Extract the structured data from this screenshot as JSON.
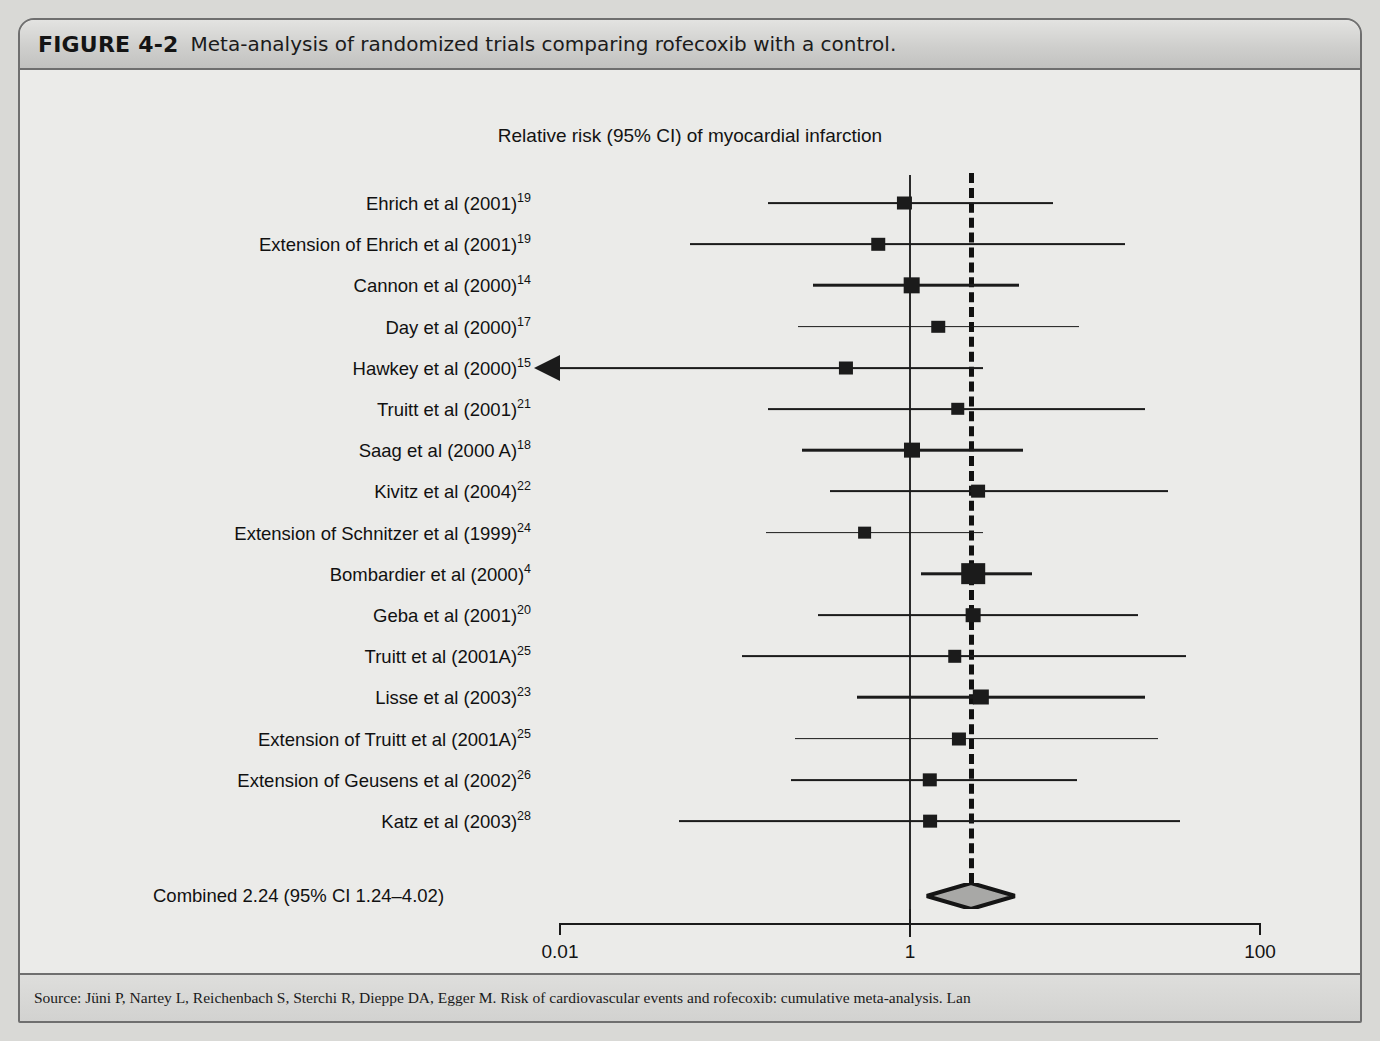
{
  "figure": {
    "label": "FIGURE 4-2",
    "caption": "Meta-analysis of randomized trials comparing rofecoxib with a control.",
    "source_text": "Source: Jüni P, Nartey L, Reichenbach S, Sterchi R, Dieppe DA, Egger M. Risk of cardiovascular events and rofecoxib: cumulative meta-analysis. Lan"
  },
  "chart_data": {
    "type": "forest",
    "title": "Relative risk (95% CI) of myocardial infarction",
    "xlabel": "",
    "ylabel": "",
    "xscale": "log",
    "xlim": [
      0.01,
      100
    ],
    "xticks": [
      0.01,
      1,
      100
    ],
    "xtick_labels": [
      "0.01",
      "1",
      "100"
    ],
    "left_foot_label": "Favours rofecoxib",
    "right_foot_label": "Favours control",
    "reference_line": 1,
    "pooled_line": 2.24,
    "grid": false,
    "legend": "none",
    "combined_label": "Combined 2.24 (95% CI 1.24–4.02)",
    "combined": {
      "estimate": 2.24,
      "ci_low": 1.24,
      "ci_high": 4.02
    },
    "studies": [
      {
        "label": "Ehrich et al (2001)",
        "ref": "19",
        "estimate": 0.93,
        "ci_low": 0.155,
        "ci_high": 6.6,
        "weight": 2.2,
        "arrow_left": false
      },
      {
        "label": "Extension of Ehrich et al (2001)",
        "ref": "19",
        "estimate": 0.66,
        "ci_low": 0.055,
        "ci_high": 17.0,
        "weight": 2.0,
        "arrow_left": false
      },
      {
        "label": "Cannon et al (2000)",
        "ref": "14",
        "estimate": 1.02,
        "ci_low": 0.28,
        "ci_high": 4.2,
        "weight": 3.0,
        "arrow_left": false
      },
      {
        "label": "Day et al (2000)",
        "ref": "17",
        "estimate": 1.45,
        "ci_low": 0.23,
        "ci_high": 9.2,
        "weight": 2.0,
        "arrow_left": false
      },
      {
        "label": "Hawkey et al (2000)",
        "ref": "15",
        "estimate": 0.43,
        "ci_low": 0.01,
        "ci_high": 2.6,
        "weight": 2.2,
        "arrow_left": true
      },
      {
        "label": "Truitt et al (2001)",
        "ref": "21",
        "estimate": 1.88,
        "ci_low": 0.155,
        "ci_high": 22.0,
        "weight": 2.0,
        "arrow_left": false
      },
      {
        "label": "Saag et al (2000 A)",
        "ref": "18",
        "estimate": 1.02,
        "ci_low": 0.24,
        "ci_high": 4.4,
        "weight": 2.8,
        "arrow_left": false
      },
      {
        "label": "Kivitz et al (2004)",
        "ref": "22",
        "estimate": 2.45,
        "ci_low": 0.35,
        "ci_high": 30.0,
        "weight": 2.1,
        "arrow_left": false
      },
      {
        "label": "Extension of Schnitzer et al (1999)",
        "ref": "24",
        "estimate": 0.55,
        "ci_low": 0.15,
        "ci_high": 2.6,
        "weight": 2.1,
        "arrow_left": false
      },
      {
        "label": "Bombardier et al (2000)",
        "ref": "4",
        "estimate": 2.3,
        "ci_low": 1.15,
        "ci_high": 5.0,
        "weight": 5.2,
        "arrow_left": false
      },
      {
        "label": "Geba et al (2001)",
        "ref": "20",
        "estimate": 2.3,
        "ci_low": 0.3,
        "ci_high": 20.0,
        "weight": 2.4,
        "arrow_left": false
      },
      {
        "label": "Truitt et al (2001A)",
        "ref": "25",
        "estimate": 1.8,
        "ci_low": 0.11,
        "ci_high": 38.0,
        "weight": 2.0,
        "arrow_left": false
      },
      {
        "label": "Lisse et al (2003)",
        "ref": "23",
        "estimate": 2.55,
        "ci_low": 0.5,
        "ci_high": 22.0,
        "weight": 2.9,
        "arrow_left": false
      },
      {
        "label": "Extension of Truitt et al (2001A)",
        "ref": "25",
        "estimate": 1.9,
        "ci_low": 0.22,
        "ci_high": 26.0,
        "weight": 2.2,
        "arrow_left": false
      },
      {
        "label": "Extension of Geusens et al (2002)",
        "ref": "26",
        "estimate": 1.3,
        "ci_low": 0.21,
        "ci_high": 9.0,
        "weight": 2.3,
        "arrow_left": false
      },
      {
        "label": "Katz et al (2003)",
        "ref": "28",
        "estimate": 1.3,
        "ci_low": 0.048,
        "ci_high": 35.0,
        "weight": 2.1,
        "arrow_left": false
      }
    ]
  }
}
